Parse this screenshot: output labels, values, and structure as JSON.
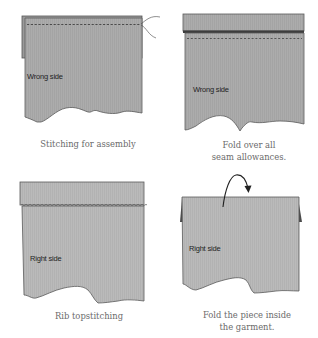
{
  "colors": {
    "fabric": "#a9a9a9",
    "fabric_light": "#b7b7b7",
    "outline": "#5a5a5a",
    "dark_seam": "#3d3d3d",
    "caption": "#6a6a6a",
    "label": "#1f1f1f"
  },
  "panels": [
    {
      "id": "stitching-for-assembly",
      "fabric_label": "Wrong side",
      "caption_lines": [
        "Stitching for assembly"
      ]
    },
    {
      "id": "fold-over-seam-allowances",
      "fabric_label": "Wrong side",
      "caption_lines": [
        "Fold over all",
        "seam allowances."
      ]
    },
    {
      "id": "rib-topstitching",
      "fabric_label": "Right side",
      "caption_lines": [
        "Rib topstitching"
      ]
    },
    {
      "id": "fold-piece-inside",
      "fabric_label": "Right side",
      "caption_lines": [
        "Fold the piece inside",
        "the garment."
      ]
    }
  ]
}
